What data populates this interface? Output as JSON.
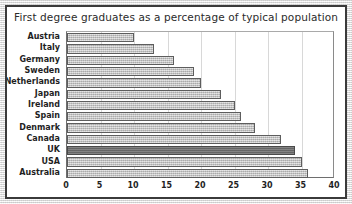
{
  "chart_data": {
    "type": "bar",
    "orientation": "horizontal",
    "title": "First degree graduates as a percentage of typical population",
    "xlabel": "",
    "ylabel": "",
    "xlim": [
      0,
      40
    ],
    "xticks": [
      0,
      5,
      10,
      15,
      20,
      25,
      30,
      35,
      40
    ],
    "grid": "vertical",
    "legend": "none",
    "categories": [
      "Austria",
      "Italy",
      "Germany",
      "Sweden",
      "Netherlands",
      "Japan",
      "Ireland",
      "Spain",
      "Denmark",
      "Canada",
      "UK",
      "USA",
      "Australia"
    ],
    "values": [
      10,
      13,
      16,
      19,
      20,
      23,
      25,
      26,
      28,
      32,
      34,
      35,
      36
    ],
    "highlight_category": "UK",
    "colors": {
      "bar_fill": "#b6b6b6",
      "bar_border": "#5d5d5d",
      "highlight_fill": "#6f6f6f",
      "highlight_border": "#4a4a4a",
      "plot_background": "#ffffff",
      "gridline": "#d8d8d8",
      "axis_line": "#6e6e6e",
      "title_text": "#2b2b2b",
      "label_text": "#1f1f1f",
      "card_border": "#3a3a3a",
      "page_background": "#e9e9e9"
    }
  }
}
